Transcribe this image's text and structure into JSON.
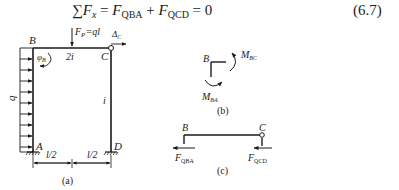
{
  "equation": {
    "sum_symbol": "∑",
    "lhs_var": "F",
    "lhs_sub": "x",
    "equals1": " = ",
    "term1_var": "F",
    "term1_sub": "QBA",
    "plus": " + ",
    "term2_var": "F",
    "term2_sub": "QCD",
    "equals2": " = 0",
    "number": "(6.7)"
  },
  "figure_a": {
    "caption": "(a)",
    "node_B": "B",
    "node_C": "C",
    "node_A": "A",
    "node_D": "D",
    "load_label": "q",
    "point_load_label": "F",
    "point_load_sub": "P",
    "point_load_rhs": "=ql",
    "beam_stiffness": "2i",
    "column_stiffness": "i",
    "rotation_label": "φ",
    "rotation_sub": "B",
    "displacement_label": "Δ",
    "displacement_sub": "C",
    "dim_left": "l/2",
    "dim_right": "l/2"
  },
  "figure_b": {
    "caption": "(b)",
    "node_B": "B",
    "moment_bc": "M",
    "moment_bc_sub": "BC",
    "moment_ba": "M",
    "moment_ba_sub": "BA"
  },
  "figure_c": {
    "caption": "(c)",
    "node_B": "B",
    "node_C": "C",
    "force_left": "F",
    "force_left_sub": "QBA",
    "force_right": "F",
    "force_right_sub": "QCD"
  }
}
